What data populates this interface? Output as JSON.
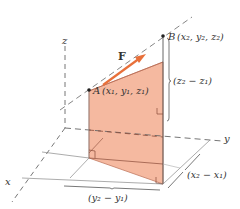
{
  "diagram": {
    "title": "",
    "axes": {
      "x_label": "x",
      "y_label": "y",
      "z_label": "z"
    },
    "points": {
      "A": {
        "name": "A",
        "label": "A (x1, y1, z1)",
        "coords_text": "(x₁, y₁, z₁)"
      },
      "B": {
        "name": "B",
        "label": "B (x2, y2, z2)",
        "coords_text": "(x₂, y₂, z₂)"
      }
    },
    "force": {
      "label": "F",
      "color": "#e8703a"
    },
    "dimensions": {
      "dz": "(z₂ − z₁)",
      "dy": "(y₂ − y₁)",
      "dx": "(x₂ − x₁)"
    },
    "colors": {
      "shaded_plane": "#f5b9a0",
      "plane_edge": "#c0705a",
      "line": "#555555",
      "dashed": "#666666"
    }
  }
}
